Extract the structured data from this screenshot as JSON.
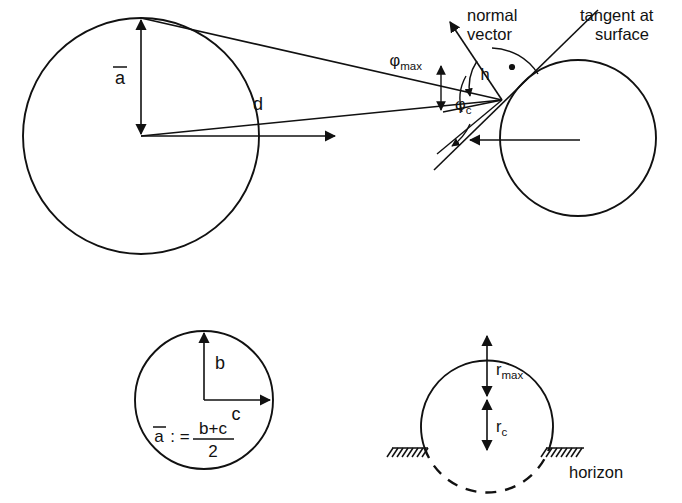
{
  "figure": {
    "background_color": "#ffffff",
    "stroke_color": "#111111"
  },
  "top_diagram": {
    "name": "two-body-geometry",
    "labels": {
      "mean_radius": "a",
      "mean_radius_overbar": "̄",
      "distance": "d",
      "phi_max": "φ",
      "phi_max_sub": "max",
      "phi_c": "φ",
      "phi_c_sub": "c",
      "h": "h",
      "normal_vector_line1": "normal",
      "normal_vector_line2": "vector",
      "tangent_line1": "tangent at",
      "tangent_line2": "surface"
    },
    "left_body": {
      "center_x": 141,
      "center_y": 136,
      "radius": 117
    },
    "right_body": {
      "center_x": 578,
      "center_y": 138,
      "radius": 78
    },
    "contact_point_x": 500,
    "contact_point_y": 100
  },
  "bottom_left_diagram": {
    "name": "mean-radius-definition",
    "center_x": 204,
    "center_y": 400,
    "radius": 69,
    "labels": {
      "b": "b",
      "c": "c",
      "formula_lhs": "a",
      "formula_overbar": "̄",
      "formula_colon_eq": ": =",
      "formula_numerator": "b+c",
      "formula_denominator": "2"
    }
  },
  "bottom_right_diagram": {
    "name": "horizon-radii-definition",
    "center_x": 487,
    "center_y": 400,
    "radius": 66,
    "labels": {
      "r_max": "r",
      "r_max_sub": "max",
      "r_c": "r",
      "r_c_sub": "c",
      "horizon": "horizon"
    },
    "horizon_y": 448
  }
}
